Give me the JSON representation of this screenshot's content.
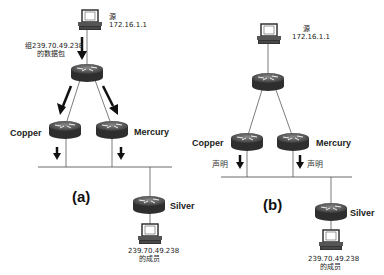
{
  "panel_a": {
    "caption": "(a)",
    "source_label": "源",
    "source_ip": "172.16.1.1",
    "packet_label_line1": "组239.70.49.238",
    "packet_label_line2": "的数据包",
    "router_left": "Copper",
    "router_right": "Mercury",
    "router_bottom": "Silver",
    "member_ip": "239.70.49.238",
    "member_label": "的成员"
  },
  "panel_b": {
    "caption": "(b)",
    "source_label": "源",
    "source_ip": "172.16.1.1",
    "router_left": "Copper",
    "router_right": "Mercury",
    "router_bottom": "Silver",
    "assert_left": "声明",
    "assert_right": "声明",
    "member_ip": "239.70.49.238",
    "member_label": "的成员"
  }
}
